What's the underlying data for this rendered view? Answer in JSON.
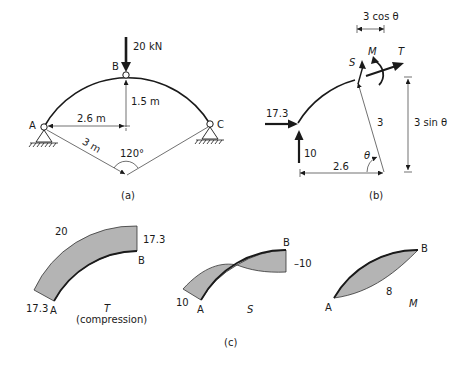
{
  "figure_a": {
    "caption": "(a)",
    "load_label": "20 kN",
    "node_a": "A",
    "node_b": "B",
    "node_c": "C",
    "rise_label": "1.5 m",
    "half_span_label": "2.6 m",
    "radius_label": "3 m",
    "angle_label": "120°"
  },
  "figure_b": {
    "caption": "(b)",
    "horizontal_reaction": "17.3",
    "vertical_reaction": "10",
    "shear_label": "S",
    "moment_label": "M",
    "thrust_label": "T",
    "radius_label": "3",
    "theta_label": "θ",
    "base_dim_label": "2.6",
    "cos_dim_label": "3 cos θ",
    "sin_dim_label": "3 sin θ"
  },
  "figure_c": {
    "caption": "(c)",
    "thrust_diagram": {
      "value_a": "17.3",
      "value_top": "20",
      "value_b": "17.3",
      "node_a": "A",
      "node_b": "B",
      "symbol": "T",
      "note": "(compression)"
    },
    "shear_diagram": {
      "value_a": "10",
      "value_b": "–10",
      "node_a": "A",
      "node_b": "B",
      "symbol": "S"
    },
    "moment_diagram": {
      "value_mid": "8",
      "node_a": "A",
      "node_b": "B",
      "symbol": "M"
    }
  }
}
